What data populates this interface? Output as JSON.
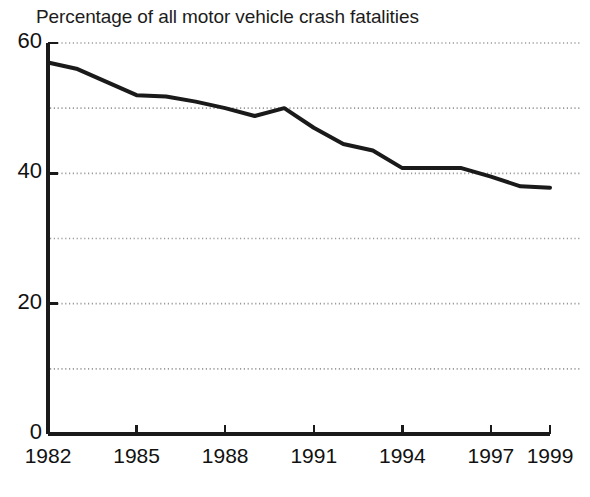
{
  "chart_data": {
    "type": "line",
    "title": "Percentage of all motor vehicle crash fatalities",
    "xlabel": "",
    "ylabel": "",
    "x": [
      1982,
      1983,
      1984,
      1985,
      1986,
      1987,
      1988,
      1989,
      1990,
      1991,
      1992,
      1993,
      1994,
      1995,
      1996,
      1997,
      1998,
      1999
    ],
    "values": [
      57,
      56,
      54,
      52,
      51.8,
      51,
      50,
      48.8,
      50,
      47,
      44.5,
      43.5,
      40.8,
      40.8,
      40.8,
      39.5,
      38,
      37.8
    ],
    "series": [
      {
        "name": "Percentage of all motor vehicle crash fatalities",
        "values": [
          57,
          56,
          54,
          52,
          51.8,
          51,
          50,
          48.8,
          50,
          47,
          44.5,
          43.5,
          40.8,
          40.8,
          40.8,
          39.5,
          38,
          37.8
        ]
      }
    ],
    "xlim": [
      1982,
      1999
    ],
    "ylim": [
      0,
      60
    ],
    "y_tick_labels": [
      "0",
      "20",
      "40",
      "60"
    ],
    "y_tick_values": [
      0,
      20,
      40,
      60
    ],
    "y_gridline_values": [
      10,
      20,
      30,
      40,
      50,
      60
    ],
    "x_tick_labels": [
      "1982",
      "1985",
      "1988",
      "1991",
      "1994",
      "1997",
      "1999"
    ],
    "x_tick_values": [
      1982,
      1985,
      1988,
      1991,
      1994,
      1997,
      1999
    ],
    "grid": true,
    "legend": "none",
    "line_color": "#1a1a1a",
    "grid_color": "#9a9a9a",
    "axis_color": "#1a1a1a",
    "background_color": "#ffffff"
  }
}
